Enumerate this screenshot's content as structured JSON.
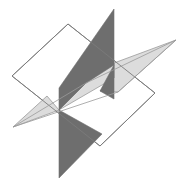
{
  "figure": {
    "kind": "geometric-line-drawing",
    "background_color": "#ffffff",
    "canvas": {
      "width": 196,
      "height": 178
    },
    "outline_color": "#7a7a7a",
    "outline_width": 0.9,
    "center_point": {
      "x": 59,
      "y": 110
    },
    "palette": {
      "white_plane_fill": "#ffffff",
      "dark_plane_fill": "#6e6e6e",
      "light_plane_fill": "#dcdcdc",
      "outline": "#7a7a7a"
    },
    "planes": [
      {
        "name": "white-plane",
        "label": "White plane",
        "fill": "#ffffff",
        "stroke": "#7a7a7a",
        "vertices": [
          {
            "x": 68,
            "y": 24
          },
          {
            "x": 155,
            "y": 93
          },
          {
            "x": 100,
            "y": 146
          },
          {
            "x": 12,
            "y": 76
          }
        ]
      },
      {
        "name": "dark-plane",
        "label": "Dark gray plane",
        "fill": "#6e6e6e",
        "stroke": "#6e6e6e",
        "vertices": [
          {
            "x": 114,
            "y": 9
          },
          {
            "x": 114,
            "y": 99
          },
          {
            "x": 59,
            "y": 178
          },
          {
            "x": 59,
            "y": 88
          }
        ]
      },
      {
        "name": "light-plane",
        "label": "Light gray plane",
        "fill": "#dcdcdc",
        "stroke": "#9a9a9a",
        "vertices": [
          {
            "x": 176,
            "y": 40
          },
          {
            "x": 118,
            "y": 92
          },
          {
            "x": 13,
            "y": 127
          },
          {
            "x": 86,
            "y": 83
          }
        ]
      }
    ],
    "visible_fragments": [
      {
        "name": "dark-upper-wing",
        "belongs_to": "dark-plane",
        "fill": "#6e6e6e",
        "vertices": [
          {
            "x": 114,
            "y": 9
          },
          {
            "x": 114,
            "y": 65
          },
          {
            "x": 86,
            "y": 83
          },
          {
            "x": 59,
            "y": 110
          },
          {
            "x": 59,
            "y": 88
          }
        ]
      },
      {
        "name": "dark-right-sliver",
        "belongs_to": "dark-plane",
        "fill": "#6e6e6e",
        "vertices": [
          {
            "x": 114,
            "y": 65
          },
          {
            "x": 114,
            "y": 99
          },
          {
            "x": 100,
            "y": 91
          }
        ]
      },
      {
        "name": "dark-lower-wing",
        "belongs_to": "dark-plane",
        "fill": "#6e6e6e",
        "vertices": [
          {
            "x": 59,
            "y": 110
          },
          {
            "x": 102,
            "y": 134
          },
          {
            "x": 59,
            "y": 178
          }
        ]
      },
      {
        "name": "light-right-wedge",
        "belongs_to": "light-plane",
        "fill": "#dcdcdc",
        "vertices": [
          {
            "x": 176,
            "y": 40
          },
          {
            "x": 118,
            "y": 92
          },
          {
            "x": 100,
            "y": 91
          },
          {
            "x": 114,
            "y": 78
          },
          {
            "x": 114,
            "y": 63
          }
        ]
      },
      {
        "name": "light-center-band",
        "belongs_to": "light-plane",
        "fill": "#dcdcdc",
        "vertices": [
          {
            "x": 114,
            "y": 63
          },
          {
            "x": 114,
            "y": 78
          },
          {
            "x": 59,
            "y": 110
          },
          {
            "x": 86,
            "y": 83
          }
        ]
      },
      {
        "name": "light-left-wedge",
        "belongs_to": "light-plane",
        "fill": "#dcdcdc",
        "vertices": [
          {
            "x": 59,
            "y": 110
          },
          {
            "x": 13,
            "y": 127
          },
          {
            "x": 47,
            "y": 96
          }
        ]
      }
    ],
    "edges": [
      {
        "name": "white-top-left-edge",
        "from": {
          "x": 12,
          "y": 76
        },
        "to": {
          "x": 68,
          "y": 24
        }
      },
      {
        "name": "white-top-right-edge",
        "from": {
          "x": 68,
          "y": 24
        },
        "to": {
          "x": 155,
          "y": 93
        }
      },
      {
        "name": "white-bottom-right-edge",
        "from": {
          "x": 155,
          "y": 93
        },
        "to": {
          "x": 100,
          "y": 146
        }
      },
      {
        "name": "white-bottom-left-edge",
        "from": {
          "x": 100,
          "y": 146
        },
        "to": {
          "x": 12,
          "y": 76
        }
      },
      {
        "name": "light-upper-edge",
        "from": {
          "x": 176,
          "y": 40
        },
        "to": {
          "x": 86,
          "y": 83
        }
      },
      {
        "name": "light-lower-edge",
        "from": {
          "x": 118,
          "y": 92
        },
        "to": {
          "x": 13,
          "y": 127
        }
      },
      {
        "name": "light-right-cap-edge",
        "from": {
          "x": 176,
          "y": 40
        },
        "to": {
          "x": 118,
          "y": 92
        }
      },
      {
        "name": "light-left-cap-edge",
        "from": {
          "x": 86,
          "y": 83
        },
        "to": {
          "x": 13,
          "y": 127
        }
      }
    ]
  }
}
